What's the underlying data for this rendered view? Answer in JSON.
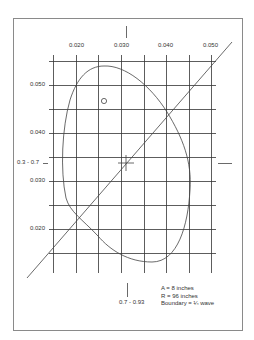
{
  "diagram": {
    "x_axis": {
      "tick_labels": [
        "0.020",
        "0.030",
        "0.040",
        "0.050"
      ]
    },
    "y_axis": {
      "tick_labels": [
        "0.050",
        "0.040",
        "0.030",
        "0.020"
      ]
    },
    "center_marks": {
      "left_label": "0.3 - 0.7",
      "bottom_label": "0.7 - 0.93"
    },
    "notes": {
      "line1": "A = 8 inches",
      "line2": "R = 96 inches",
      "line3": "Boundary = ¼ wave"
    },
    "markers": {
      "circle_marker": "circle-marker",
      "center_cross": "crosshair-marker"
    },
    "colors": {
      "frame": "#8a8a8a",
      "grid": "#333333",
      "curve": "#444444",
      "text": "#333333"
    }
  }
}
